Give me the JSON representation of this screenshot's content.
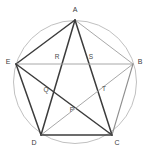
{
  "figure": {
    "canvas": {
      "width": 149,
      "height": 151,
      "background": "#ffffff"
    },
    "circle": {
      "name": "circumscribed-circle",
      "cx": 75,
      "cy": 82,
      "r": 61.5,
      "stroke": "#b9b9b9",
      "stroke_width": 0.9,
      "fill": "none"
    },
    "colors": {
      "dark_edge": "#3c3c3c",
      "light_edge": "#a8a8a8",
      "mid_edge": "#8f8f8f",
      "circle_stroke": "#b9b9b9",
      "label_text": "#3a3a3a",
      "background": "#ffffff"
    },
    "vertices": [
      {
        "id": "A",
        "label": "A",
        "x": 75,
        "y": 20,
        "label_x": 75,
        "label_y": 10
      },
      {
        "id": "B",
        "label": "B",
        "x": 133,
        "y": 64,
        "label_x": 140,
        "label_y": 62
      },
      {
        "id": "C",
        "label": "C",
        "x": 112,
        "y": 135,
        "label_x": 117,
        "label_y": 143
      },
      {
        "id": "D",
        "label": "D",
        "x": 41,
        "y": 135,
        "label_x": 34,
        "label_y": 143
      },
      {
        "id": "E",
        "label": "E",
        "x": 16,
        "y": 64,
        "label_x": 8,
        "label_y": 62
      }
    ],
    "intersection_points": [
      {
        "id": "P",
        "label": "P",
        "x": 72,
        "y": 115,
        "label_x": 72,
        "label_y": 110
      },
      {
        "id": "Q",
        "label": "Q",
        "x": 49,
        "y": 94,
        "label_x": 46,
        "label_y": 90
      },
      {
        "id": "R",
        "label": "R",
        "x": 58,
        "y": 64,
        "label_x": 57,
        "label_y": 57
      },
      {
        "id": "S",
        "label": "S",
        "x": 92,
        "y": 64,
        "label_x": 91,
        "label_y": 57
      },
      {
        "id": "T",
        "label": "T",
        "x": 101,
        "y": 94,
        "label_x": 104,
        "label_y": 89
      }
    ],
    "segments": [
      {
        "name": "segment-A-E",
        "from": "A",
        "to": "E",
        "x1": 75,
        "y1": 20,
        "x2": 16,
        "y2": 64,
        "stroke": "#3c3c3c",
        "stroke_width": 1.5
      },
      {
        "name": "segment-A-B",
        "from": "A",
        "to": "B",
        "x1": 75,
        "y1": 20,
        "x2": 133,
        "y2": 64,
        "stroke": "#a8a8a8",
        "stroke_width": 1.0
      },
      {
        "name": "segment-A-C",
        "from": "A",
        "to": "C",
        "x1": 75,
        "y1": 20,
        "x2": 112,
        "y2": 135,
        "stroke": "#3c3c3c",
        "stroke_width": 1.5
      },
      {
        "name": "segment-A-D",
        "from": "A",
        "to": "D",
        "x1": 75,
        "y1": 20,
        "x2": 41,
        "y2": 135,
        "stroke": "#3c3c3c",
        "stroke_width": 1.5
      },
      {
        "name": "segment-E-B",
        "from": "E",
        "to": "B",
        "x1": 16,
        "y1": 64,
        "x2": 133,
        "y2": 64,
        "stroke": "#a8a8a8",
        "stroke_width": 1.0
      },
      {
        "name": "segment-E-C",
        "from": "E",
        "to": "C",
        "x1": 16,
        "y1": 64,
        "x2": 112,
        "y2": 135,
        "stroke": "#3c3c3c",
        "stroke_width": 1.5
      },
      {
        "name": "segment-E-D",
        "from": "E",
        "to": "D",
        "x1": 16,
        "y1": 64,
        "x2": 41,
        "y2": 135,
        "stroke": "#3c3c3c",
        "stroke_width": 1.5
      },
      {
        "name": "segment-B-D",
        "from": "B",
        "to": "D",
        "x1": 133,
        "y1": 64,
        "x2": 41,
        "y2": 135,
        "stroke": "#a8a8a8",
        "stroke_width": 1.0
      },
      {
        "name": "segment-B-C",
        "from": "B",
        "to": "C",
        "x1": 133,
        "y1": 64,
        "x2": 112,
        "y2": 135,
        "stroke": "#8f8f8f",
        "stroke_width": 1.1
      },
      {
        "name": "segment-D-C",
        "from": "D",
        "to": "C",
        "x1": 41,
        "y1": 135,
        "x2": 112,
        "y2": 135,
        "stroke": "#3c3c3c",
        "stroke_width": 1.5
      }
    ]
  }
}
